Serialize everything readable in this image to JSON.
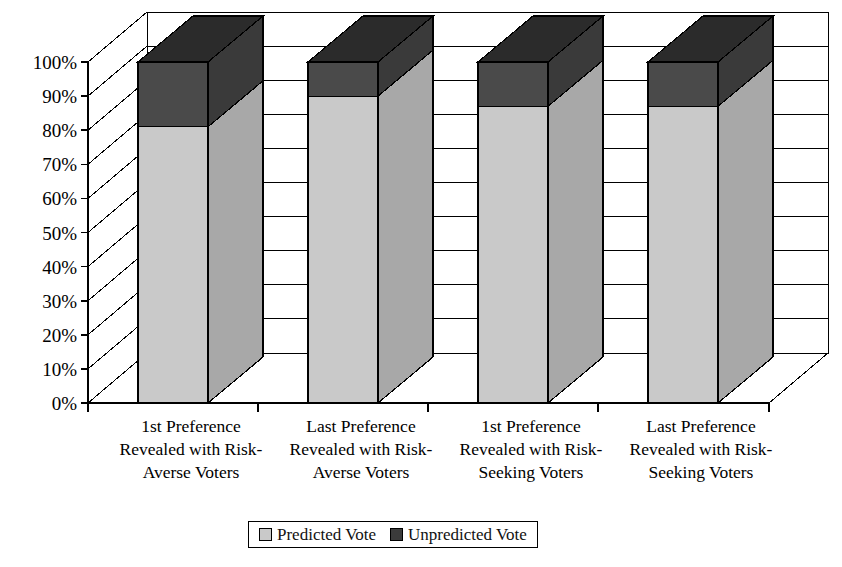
{
  "chart_data": {
    "type": "bar",
    "subtype": "stacked-3d-column",
    "title": "",
    "xlabel": "",
    "ylabel": "",
    "ylim": [
      0,
      100
    ],
    "y_tick_labels": [
      "0%",
      "10%",
      "20%",
      "30%",
      "40%",
      "50%",
      "60%",
      "70%",
      "80%",
      "90%",
      "100%"
    ],
    "y_tick_values": [
      0,
      10,
      20,
      30,
      40,
      50,
      60,
      70,
      80,
      90,
      100
    ],
    "grid": true,
    "legend_position": "bottom",
    "categories": [
      "1st Preference Revealed with Risk-Averse Voters",
      "Last Preference Revealed with Risk-Averse Voters",
      "1st Preference Revealed with Risk-Seeking Voters",
      "Last Preference Revealed with Risk-Seeking Voters"
    ],
    "category_lines": [
      [
        "1st Preference",
        "Revealed with Risk-",
        "Averse Voters"
      ],
      [
        "Last Preference",
        "Revealed with Risk-",
        "Averse Voters"
      ],
      [
        "1st Preference",
        "Revealed with Risk-",
        "Seeking Voters"
      ],
      [
        "Last Preference",
        "Revealed with Risk-",
        "Seeking Voters"
      ]
    ],
    "series": [
      {
        "name": "Predicted Vote",
        "color": "#c9c9c9",
        "values": [
          81,
          90,
          87,
          87
        ]
      },
      {
        "name": "Unpredicted Vote",
        "color": "#4a4a4a",
        "values": [
          19,
          10,
          13,
          13
        ]
      }
    ]
  },
  "legend": {
    "items": [
      {
        "label": "Predicted Vote",
        "swatch": "light-swatch-icon",
        "color": "#c9c9c9"
      },
      {
        "label": "Unpredicted Vote",
        "swatch": "dark-swatch-icon",
        "color": "#3b3b3b"
      }
    ]
  },
  "colors": {
    "predicted_front": "#c9c9c9",
    "predicted_side": "#a8a8a8",
    "predicted_top": "#dcdcdc",
    "unpredicted_front": "#4a4a4a",
    "unpredicted_side": "#3a3a3a",
    "unpredicted_top": "#2b2b2b",
    "floor": "#ffffff",
    "wall": "#ffffff",
    "outline": "#000000",
    "gridline": "#000000"
  }
}
